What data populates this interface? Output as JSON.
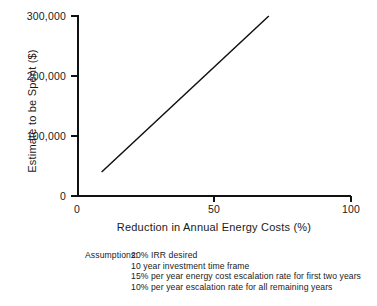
{
  "chart_data": {
    "type": "line",
    "title": "",
    "xlabel": "Reduction in Annual Energy Costs (%)",
    "ylabel": "Estimate to be Spent ($)",
    "xlim": [
      0,
      100
    ],
    "ylim": [
      0,
      300000
    ],
    "grid": false,
    "legend": "none",
    "xticks": [
      {
        "value": 0,
        "label": "0"
      },
      {
        "value": 50,
        "label": "50"
      },
      {
        "value": 100,
        "label": "100"
      }
    ],
    "yticks": [
      {
        "value": 0,
        "label": "0"
      },
      {
        "value": 100000,
        "label": "100,000"
      },
      {
        "value": 200000,
        "label": "200,000"
      },
      {
        "value": 300000,
        "label": "300,000"
      }
    ],
    "series": [
      {
        "name": "Estimate to be Spent",
        "color": "#111111",
        "x": [
          9,
          70
        ],
        "y": [
          40000,
          300000
        ]
      }
    ],
    "annotations": {
      "assumptions_label": "Assumptions:",
      "assumptions_items": [
        "20% IRR desired",
        "10 year investment time frame",
        "15% per year energy cost escalation rate for first two years",
        "10% per year escalation rate for all remaining years"
      ]
    }
  }
}
